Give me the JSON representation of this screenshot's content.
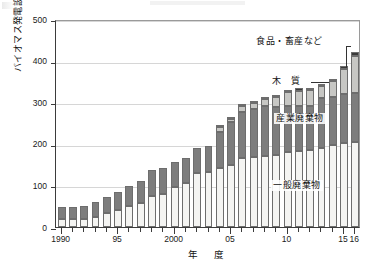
{
  "chart_data": {
    "type": "bar",
    "subtype": "stacked-vertical",
    "title": "",
    "xlabel": "年　度",
    "ylabel": "バイオマス発電設備容量［万 kW］",
    "ylim": [
      0,
      500
    ],
    "ytick_values": [
      0,
      100,
      200,
      300,
      400,
      500
    ],
    "ytick_labels": [
      "0",
      "100",
      "200",
      "300",
      "400",
      "500"
    ],
    "grid": "horizontal",
    "legend_position": "in-plot annotations",
    "x": [
      1990,
      1991,
      1992,
      1993,
      1994,
      1995,
      1996,
      1997,
      1998,
      1999,
      2000,
      2001,
      2002,
      2003,
      2004,
      2005,
      2006,
      2007,
      2008,
      2009,
      2010,
      2011,
      2012,
      2013,
      2014,
      2015,
      2016
    ],
    "categories": [
      "1990",
      "1991",
      "1992",
      "1993",
      "1994",
      "1995",
      "1996",
      "1997",
      "1998",
      "1999",
      "2000",
      "2001",
      "2002",
      "2003",
      "2004",
      "2005",
      "2006",
      "2007",
      "2008",
      "2009",
      "2010",
      "2011",
      "2012",
      "2013",
      "2014",
      "2015",
      "2016"
    ],
    "xtick_labels": [
      {
        "value": 1990,
        "label": "1990"
      },
      {
        "value": 1995,
        "label": "95"
      },
      {
        "value": 2000,
        "label": "2000"
      },
      {
        "value": 2005,
        "label": "05"
      },
      {
        "value": 2010,
        "label": "10"
      },
      {
        "value": 2015,
        "label": "15"
      },
      {
        "value": 2016,
        "label": "16"
      }
    ],
    "series": [
      {
        "name": "一般廃棄物",
        "color": "#f4f4f2",
        "values": [
          19,
          19,
          20,
          23,
          34,
          42,
          50,
          58,
          75,
          80,
          97,
          105,
          130,
          133,
          142,
          148,
          165,
          168,
          170,
          172,
          181,
          182,
          184,
          190,
          198,
          202,
          205
        ]
      },
      {
        "name": "産業廃棄物",
        "color": "#7d7d7d",
        "values": [
          28,
          29,
          31,
          37,
          39,
          42,
          48,
          52,
          62,
          61,
          60,
          60,
          60,
          61,
          87,
          104,
          112,
          115,
          120,
          116,
          110,
          110,
          108,
          119,
          114,
          117,
          118
        ]
      },
      {
        "name": "木質",
        "color": "#c7c7c4",
        "values": [
          0,
          0,
          0,
          0,
          0,
          0,
          0,
          0,
          0,
          0,
          0,
          0,
          0,
          0,
          11,
          8,
          13,
          16,
          18,
          25,
          33,
          36,
          38,
          30,
          39,
          62,
          87
        ]
      },
      {
        "name": "食品・畜産など",
        "color": "#3a3a3a",
        "values": [
          0,
          0,
          0,
          0,
          0,
          0,
          0,
          0,
          0,
          0,
          0,
          0,
          0,
          0,
          3,
          4,
          4,
          5,
          5,
          5,
          5,
          5,
          5,
          5,
          6,
          7,
          10
        ]
      }
    ],
    "totals": [
      47,
      48,
      51,
      60,
      73,
      84,
      98,
      110,
      137,
      141,
      157,
      165,
      190,
      194,
      243,
      264,
      294,
      304,
      313,
      318,
      329,
      333,
      335,
      344,
      357,
      388,
      420
    ],
    "annotations": [
      {
        "name": "food-livestock-label",
        "text": "食品・畜産など",
        "target_series": "食品・畜産など"
      },
      {
        "name": "wood-label",
        "text": "木　質",
        "target_series": "木質"
      },
      {
        "name": "industrial-waste-label",
        "text": "産業廃棄物",
        "target_series": "産業廃棄物"
      },
      {
        "name": "general-waste-label",
        "text": "一般廃棄物",
        "target_series": "一般廃棄物"
      }
    ]
  }
}
